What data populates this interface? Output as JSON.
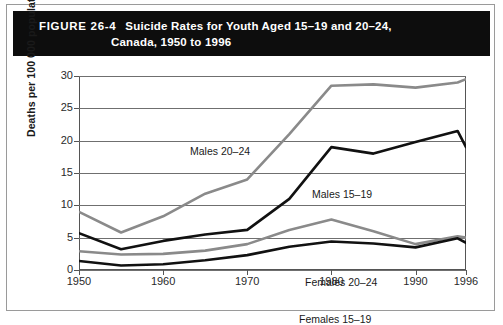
{
  "figure": {
    "number": "FIGURE 26-4",
    "title_line1": "Suicide Rates for Youth Aged 15–19 and 20–24,",
    "title_line2": "Canada, 1950 to 1996"
  },
  "axes": {
    "ylabel": "Deaths per 100 000 population",
    "yticks": [
      "30",
      "25",
      "20",
      "15",
      "10",
      "5",
      "0"
    ],
    "xticks": [
      "1950",
      "1960",
      "1970",
      "1980",
      "1990",
      "1996"
    ]
  },
  "series_labels": {
    "males_2024": "Males 20–24",
    "males_1519": "Males 15–19",
    "females_2024": "Females 20–24",
    "females_1519": "Females 15–19"
  },
  "colors": {
    "banner": "#0d0d0d",
    "dark_line": "#111111",
    "gray_line": "#8a8a8a",
    "grid": "#6f6f6f",
    "frame": "#555555",
    "page": "#ffffff"
  },
  "chart_data": {
    "type": "line",
    "title": "Suicide Rates for Youth Aged 15–19 and 20–24, Canada, 1950 to 1996",
    "xlabel": "",
    "ylabel": "Deaths per 100 000 population",
    "x": [
      1950,
      1955,
      1960,
      1965,
      1970,
      1975,
      1980,
      1985,
      1990,
      1995,
      1996
    ],
    "xlim": [
      1950,
      1996
    ],
    "ylim": [
      0,
      30
    ],
    "ytick_values": [
      0,
      5,
      10,
      15,
      20,
      25,
      30
    ],
    "xtick_values": [
      1950,
      1960,
      1970,
      1980,
      1990,
      1996
    ],
    "grid": "horizontal",
    "legend": "inline-annotations",
    "series": [
      {
        "name": "Males 20–24",
        "color": "#8a8a8a",
        "values": [
          9.0,
          5.8,
          8.3,
          11.8,
          14.0,
          21.0,
          28.5,
          28.7,
          28.2,
          29.0,
          29.5
        ]
      },
      {
        "name": "Males 15–19",
        "color": "#111111",
        "values": [
          5.7,
          3.2,
          4.5,
          5.5,
          6.2,
          11.0,
          19.0,
          18.0,
          19.8,
          21.5,
          19.0
        ]
      },
      {
        "name": "Females 20–24",
        "color": "#8a8a8a",
        "values": [
          2.9,
          2.4,
          2.5,
          3.0,
          4.0,
          6.2,
          7.8,
          6.0,
          4.0,
          5.2,
          5.0
        ]
      },
      {
        "name": "Females 15–19",
        "color": "#111111",
        "values": [
          1.4,
          0.7,
          0.9,
          1.5,
          2.3,
          3.6,
          4.4,
          4.1,
          3.5,
          4.9,
          4.2
        ]
      }
    ]
  }
}
